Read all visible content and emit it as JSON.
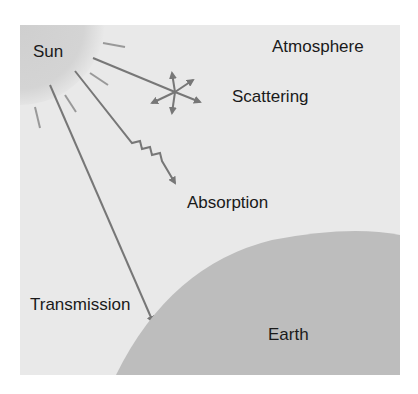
{
  "diagram": {
    "type": "schematic",
    "title": "",
    "labels": {
      "sun": "Sun",
      "atmosphere": "Atmosphere",
      "scattering": "Scattering",
      "absorption": "Absorption",
      "transmission": "Transmission",
      "earth": "Earth"
    },
    "colors": {
      "background": "#ffffff",
      "atmosphere": "#e9e9e9",
      "sun": "#d2d2d2",
      "earth": "#bcbcbc",
      "rays": "#777777",
      "text": "#1a1a1a"
    }
  }
}
